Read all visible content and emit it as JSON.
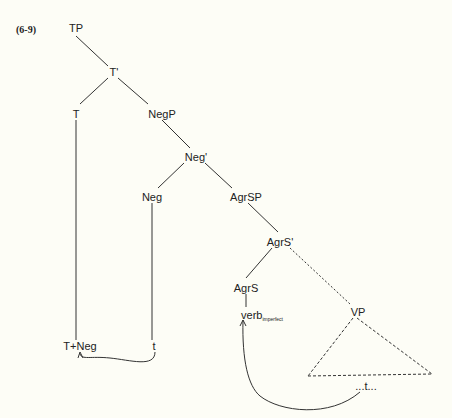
{
  "example_label": "(6-9)",
  "nodes": {
    "TP": "TP",
    "T_bar": "T'",
    "T": "T",
    "NegP": "NegP",
    "Neg_bar": "Neg'",
    "Neg": "Neg",
    "AgrSP": "AgrSP",
    "AgrS_bar": "AgrS'",
    "AgrS": "AgrS",
    "VP": "VP",
    "T_Neg": "T+Neg",
    "trace_neg": "t",
    "verb": "verb",
    "verb_sub": "imperfect",
    "trace_verb": "...t..."
  },
  "colors": {
    "background": "#fdfdf6",
    "lines": "#333333"
  }
}
